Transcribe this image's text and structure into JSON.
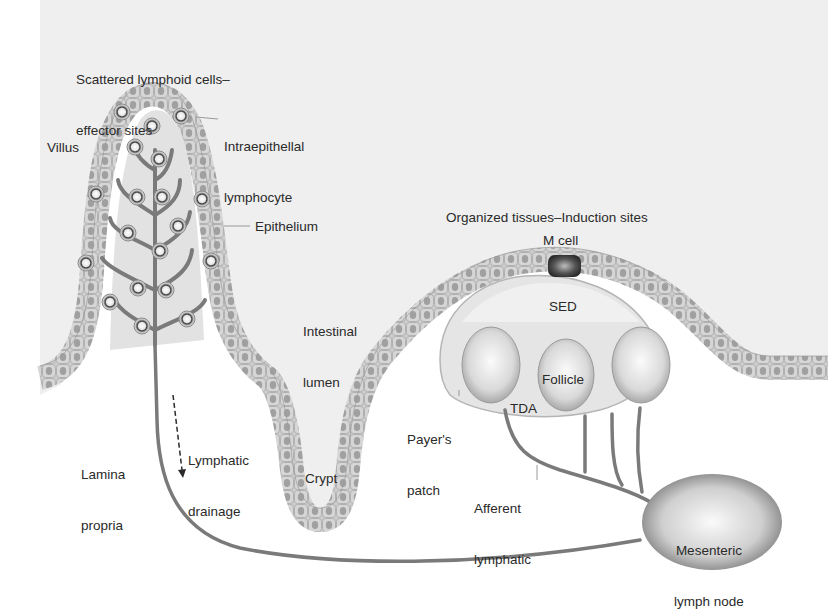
{
  "diagram": {
    "colors": {
      "background": "#ffffff",
      "lumen": "#efefef",
      "epithelium_cell": "#c9c9c9",
      "nucleus": "#9a9a9a",
      "lymph_vessel": "#7a7a7a",
      "follicle": "#d8d8d8",
      "m_cell": "#3a3a3a",
      "label_text": "#2a2a2a"
    },
    "labels": {
      "scattered": {
        "line1": "Scattered lymphoid cells–",
        "line2": "effector sites"
      },
      "intraepithelial": {
        "line1": "Intraepithellal",
        "line2": "lymphocyte"
      },
      "villus": "Villus",
      "epithelium": "Epithelium",
      "intestinal_lumen": {
        "line1": "Intestinal",
        "line2": "lumen"
      },
      "organized": "Organized tissues–Induction sites",
      "m_cell": "M cell",
      "sed": "SED",
      "follicle": "Follicle",
      "tda": "TDA",
      "payers_patch": {
        "line1": "Payer's",
        "line2": "patch"
      },
      "lamina_propria": {
        "line1": "Lamina",
        "line2": "propria"
      },
      "lymphatic_drainage": {
        "line1": "Lymphatic",
        "line2": "drainage"
      },
      "crypt": "Crypt",
      "afferent_lymphatic": {
        "line1": "Afferent",
        "line2": "lymphatic"
      },
      "mesenteric": {
        "line1": "Mesenteric",
        "line2": "lymph node"
      }
    }
  }
}
